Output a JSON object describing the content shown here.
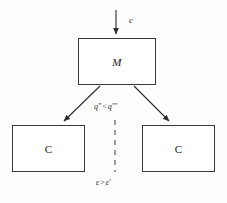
{
  "diagram": {
    "background_color": "#fdfdfd",
    "stroke_color": "#3a3a3a",
    "text_color": "#1d1d1d",
    "nodes": [
      {
        "id": "m",
        "label": "M",
        "shape": "rectangle"
      },
      {
        "id": "c_left",
        "label": "C",
        "shape": "rectangle"
      },
      {
        "id": "c_right",
        "label": "C",
        "shape": "rectangle"
      }
    ],
    "edges": [
      {
        "id": "input",
        "from": "external",
        "to": "m",
        "style": "solid",
        "arrow": "down",
        "label": "c"
      },
      {
        "id": "branch_left",
        "from": "m",
        "to": "c_left",
        "style": "solid",
        "arrow": "down-left",
        "label": ""
      },
      {
        "id": "branch_right",
        "from": "m",
        "to": "c_right",
        "style": "solid",
        "arrow": "down-right",
        "label": ""
      },
      {
        "id": "divider",
        "from": "m",
        "to": "bottom",
        "style": "dashed",
        "arrow": "none",
        "label": ""
      }
    ],
    "labels": {
      "input_label": "c",
      "branch_compare": {
        "left_term": "q″",
        "operator": "<",
        "right_term": "q′″"
      },
      "bottom_compare": {
        "left_term": "ε",
        "operator": ">",
        "right_term": "ε′"
      }
    }
  }
}
